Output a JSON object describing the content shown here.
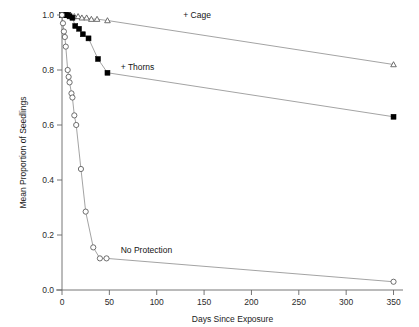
{
  "chart_data": {
    "type": "line",
    "title": "",
    "xlabel": "Days Since Exposure",
    "ylabel": "Mean Proportion of Seedlings",
    "xlim": [
      0,
      360
    ],
    "ylim": [
      0.0,
      1.0
    ],
    "grid": false,
    "legend_position": "inline-annotation",
    "xticks": [
      0,
      50,
      100,
      150,
      200,
      250,
      300,
      350
    ],
    "xticklabels": [
      "0",
      "50",
      "100",
      "150",
      "200",
      "250",
      "300",
      "350"
    ],
    "yticks": [
      0.0,
      0.2,
      0.4,
      0.6,
      0.8,
      1.0
    ],
    "yticklabels": [
      "0.0",
      "0.2",
      "0.4",
      "0.6",
      "0.8",
      "1.0"
    ],
    "series": [
      {
        "name": "+ Cage",
        "marker": "open-triangle",
        "annotation": "+ Cage",
        "annotation_x": 128,
        "annotation_y": 1.0,
        "points": [
          {
            "x": 0,
            "y": 1.0
          },
          {
            "x": 3,
            "y": 1.0
          },
          {
            "x": 6,
            "y": 1.0
          },
          {
            "x": 9,
            "y": 1.0
          },
          {
            "x": 13,
            "y": 0.995
          },
          {
            "x": 17,
            "y": 0.995
          },
          {
            "x": 21,
            "y": 0.99
          },
          {
            "x": 26,
            "y": 0.99
          },
          {
            "x": 31,
            "y": 0.985
          },
          {
            "x": 37,
            "y": 0.985
          },
          {
            "x": 48,
            "y": 0.98
          },
          {
            "x": 350,
            "y": 0.82
          }
        ]
      },
      {
        "name": "+ Thorns",
        "marker": "filled-square",
        "annotation": "+ Thorns",
        "annotation_x": 62,
        "annotation_y": 0.81,
        "points": [
          {
            "x": 0,
            "y": 1.0
          },
          {
            "x": 2,
            "y": 1.0
          },
          {
            "x": 4,
            "y": 1.0
          },
          {
            "x": 6,
            "y": 1.0
          },
          {
            "x": 8,
            "y": 0.995
          },
          {
            "x": 11,
            "y": 0.99
          },
          {
            "x": 14,
            "y": 0.96
          },
          {
            "x": 18,
            "y": 0.95
          },
          {
            "x": 22,
            "y": 0.93
          },
          {
            "x": 28,
            "y": 0.915
          },
          {
            "x": 38,
            "y": 0.84
          },
          {
            "x": 48,
            "y": 0.79
          },
          {
            "x": 350,
            "y": 0.63
          }
        ]
      },
      {
        "name": "No Protection",
        "marker": "open-circle",
        "annotation": "No Protection",
        "annotation_x": 62,
        "annotation_y": 0.145,
        "points": [
          {
            "x": 0,
            "y": 1.0
          },
          {
            "x": 1,
            "y": 0.97
          },
          {
            "x": 2,
            "y": 0.94
          },
          {
            "x": 3,
            "y": 0.92
          },
          {
            "x": 4,
            "y": 0.885
          },
          {
            "x": 6,
            "y": 0.8
          },
          {
            "x": 7,
            "y": 0.775
          },
          {
            "x": 8,
            "y": 0.755
          },
          {
            "x": 10,
            "y": 0.715
          },
          {
            "x": 11,
            "y": 0.7
          },
          {
            "x": 13,
            "y": 0.635
          },
          {
            "x": 15,
            "y": 0.6
          },
          {
            "x": 20,
            "y": 0.44
          },
          {
            "x": 25,
            "y": 0.285
          },
          {
            "x": 33,
            "y": 0.155
          },
          {
            "x": 40,
            "y": 0.115
          },
          {
            "x": 47,
            "y": 0.115
          },
          {
            "x": 350,
            "y": 0.03
          }
        ]
      }
    ]
  }
}
